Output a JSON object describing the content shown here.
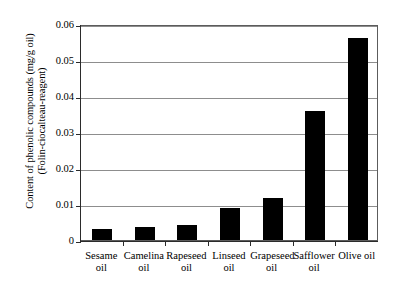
{
  "chart_data": {
    "type": "bar",
    "title": "",
    "xlabel": "",
    "ylabel": "Content of phenolic compounds (mg/g oil) (Folin-ciocalteau-reagent)",
    "ylabel_lines": [
      "Content of phenolic compounds (mg/g oil)",
      "(Folin-ciocalteau-reagent)"
    ],
    "categories": [
      "Sesame\noil",
      "Camelina\noil",
      "Rapeseed\noil",
      "Linseed\noil",
      "Grapeseed\noil",
      "Safflower\noil",
      "Olive oil"
    ],
    "values": [
      0.003,
      0.0036,
      0.0042,
      0.009,
      0.0118,
      0.0357,
      0.056
    ],
    "ylim": [
      0,
      0.06
    ],
    "ytick_labels": [
      "0.06",
      "0.05",
      "0.04",
      "0.03",
      "0.02",
      "0.01",
      "0"
    ],
    "ytick_values": [
      0.06,
      0.05,
      0.04,
      0.03,
      0.02,
      0.01,
      0
    ],
    "grid": true,
    "legend": "none",
    "bar_color": "#000000",
    "grid_color": "#8d8d8d",
    "axis_color": "#2b2b2b"
  }
}
